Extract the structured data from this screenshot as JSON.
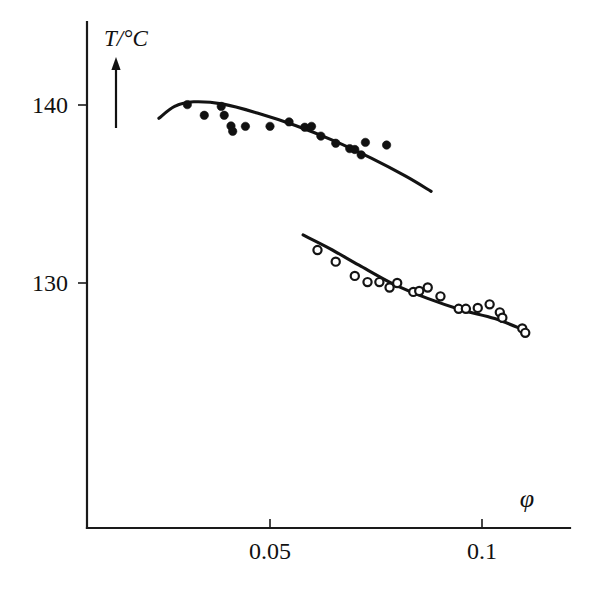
{
  "figure": {
    "title": "",
    "background_color": "#ffffff",
    "ink_color": "#111111"
  },
  "chart_data": {
    "type": "scatter",
    "title": "",
    "subtitle": "",
    "xlabel": "φ",
    "ylabel": "T/°C",
    "xlabel_display": "φ",
    "ylabel_display": "T/°C",
    "xlim": [
      0.007,
      0.125
    ],
    "ylim": [
      120.6,
      144.5
    ],
    "grid": false,
    "legend_position": "none",
    "x_ticks": [
      0.05,
      0.1
    ],
    "x_tick_labels": [
      "0.05",
      "0.1"
    ],
    "y_ticks": [
      130,
      140
    ],
    "y_tick_labels": [
      "130",
      "140"
    ],
    "axis_arrow": "up",
    "series": [
      {
        "name": "upper branch",
        "marker": "filled-circle",
        "marker_label": "filled circle",
        "color": "#111111",
        "points": [
          [
            0.0305,
            140.02
          ],
          [
            0.0345,
            139.42
          ],
          [
            0.0385,
            139.92
          ],
          [
            0.0392,
            139.42
          ],
          [
            0.0408,
            138.82
          ],
          [
            0.0412,
            138.52
          ],
          [
            0.0442,
            138.8
          ],
          [
            0.05,
            138.8
          ],
          [
            0.0545,
            139.05
          ],
          [
            0.0582,
            138.75
          ],
          [
            0.0598,
            138.8
          ],
          [
            0.062,
            138.25
          ],
          [
            0.0655,
            137.85
          ],
          [
            0.0688,
            137.55
          ],
          [
            0.07,
            137.5
          ],
          [
            0.0715,
            137.2
          ],
          [
            0.0725,
            137.9
          ],
          [
            0.0775,
            137.75
          ]
        ],
        "curve": [
          [
            0.0238,
            139.25
          ],
          [
            0.0275,
            139.92
          ],
          [
            0.032,
            140.18
          ],
          [
            0.039,
            140.05
          ],
          [
            0.047,
            139.55
          ],
          [
            0.056,
            138.85
          ],
          [
            0.065,
            138.0
          ],
          [
            0.074,
            137.0
          ],
          [
            0.082,
            136.0
          ],
          [
            0.088,
            135.15
          ]
        ]
      },
      {
        "name": "lower branch",
        "marker": "open-circle",
        "marker_label": "open circle",
        "color": "#111111",
        "points": [
          [
            0.0612,
            131.85
          ],
          [
            0.0655,
            131.2
          ],
          [
            0.07,
            130.4
          ],
          [
            0.073,
            130.05
          ],
          [
            0.0758,
            130.05
          ],
          [
            0.0782,
            129.75
          ],
          [
            0.08,
            130.0
          ],
          [
            0.0838,
            129.5
          ],
          [
            0.0852,
            129.55
          ],
          [
            0.0872,
            129.75
          ],
          [
            0.0902,
            129.25
          ],
          [
            0.0945,
            128.55
          ],
          [
            0.0962,
            128.55
          ],
          [
            0.099,
            128.6
          ],
          [
            0.1018,
            128.8
          ],
          [
            0.1042,
            128.35
          ],
          [
            0.1048,
            128.05
          ],
          [
            0.1095,
            127.45
          ],
          [
            0.1102,
            127.2
          ]
        ],
        "curve": [
          [
            0.0578,
            132.7
          ],
          [
            0.064,
            131.95
          ],
          [
            0.071,
            131.0
          ],
          [
            0.079,
            129.95
          ],
          [
            0.087,
            129.15
          ],
          [
            0.095,
            128.5
          ],
          [
            0.103,
            128.0
          ],
          [
            0.11,
            127.35
          ]
        ]
      }
    ]
  },
  "axes": {
    "x_axis_name": "phi-axis",
    "y_axis_name": "temperature-axis"
  }
}
